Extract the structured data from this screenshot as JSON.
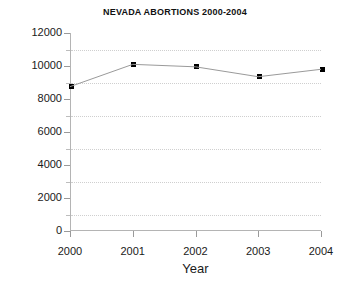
{
  "chart_data": {
    "type": "line",
    "title": "NEVADA ABORTIONS 2000-2004",
    "xlabel": "Year",
    "ylabel": "",
    "categories": [
      "2000",
      "2001",
      "2002",
      "2003",
      "2004"
    ],
    "x": [
      2000,
      2001,
      2002,
      2003,
      2004
    ],
    "values": [
      8750,
      10100,
      9950,
      9350,
      9800
    ],
    "series": [
      {
        "name": "Nevada abortions",
        "values": [
          8750,
          10100,
          9950,
          9350,
          9800
        ],
        "marker": "square",
        "marker_color": "#000000",
        "line_color": "#9a9a9a"
      }
    ],
    "xlim": [
      2000,
      2004
    ],
    "ylim": [
      0,
      12000
    ],
    "y_tick_labels": [
      "0",
      "2000",
      "4000",
      "6000",
      "8000",
      "10000",
      "12000"
    ],
    "y_ticks": [
      0,
      2000,
      4000,
      6000,
      8000,
      10000,
      12000
    ],
    "y_minor_ticks": [
      1000,
      3000,
      5000,
      7000,
      9000,
      11000
    ],
    "gridlines": [
      1000,
      3000,
      5000,
      7000,
      9000,
      11000
    ],
    "grid": true,
    "grid_style": "dotted",
    "grid_color": "#cfcfcf",
    "legend": false,
    "background_color": "#ffffff",
    "axis_color": "#b4b4b4"
  }
}
